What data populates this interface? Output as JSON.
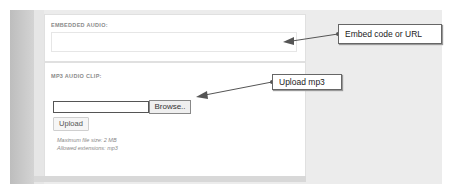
{
  "embed_section": {
    "label": "EMBEDDED AUDIO:",
    "input_value": ""
  },
  "mp3_section": {
    "label": "MP3 AUDIO CLIP:",
    "file_input_value": "",
    "browse_label": "Browse..",
    "upload_label": "Upload",
    "hint_max_size": "Maximum file size: 2 MB",
    "hint_extensions": "Allowed extensions: mp3"
  },
  "callouts": {
    "embed": "Embed code or URL",
    "upload": "Upload mp3"
  },
  "colors": {
    "background": "#ececec",
    "panel": "#ffffff",
    "left_bar": "#c4c4c4",
    "arrow": "#555555"
  }
}
